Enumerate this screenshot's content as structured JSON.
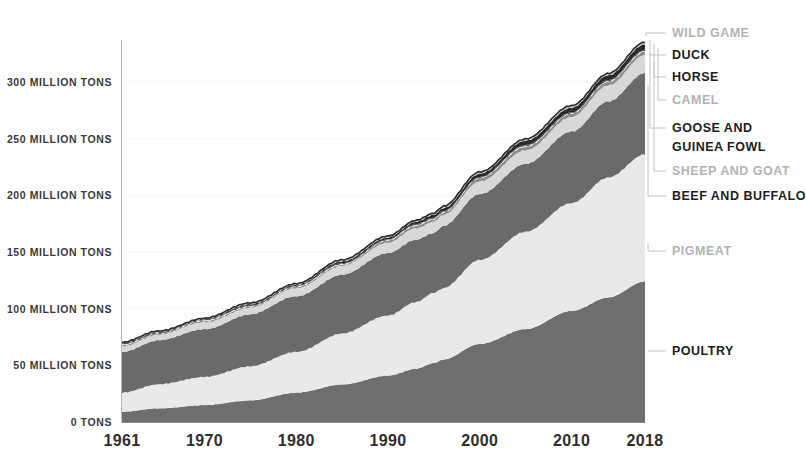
{
  "title": "",
  "axes": {
    "y_ticks": [
      {
        "label": "300 MILLION TONS",
        "value": 300
      },
      {
        "label": "250 MILLION TONS",
        "value": 250
      },
      {
        "label": "200 MILLION TONS",
        "value": 200
      },
      {
        "label": "150 MILLION TONS",
        "value": 150
      },
      {
        "label": "100 MILLION TONS",
        "value": 100
      },
      {
        "label": "50 MILLION TONS",
        "value": 50
      },
      {
        "label": "0 TONS",
        "value": 0
      }
    ],
    "x_ticks": [
      {
        "label": "1961",
        "value": 1961
      },
      {
        "label": "1970",
        "value": 1970
      },
      {
        "label": "1980",
        "value": 1980
      },
      {
        "label": "1990",
        "value": 1990
      },
      {
        "label": "2000",
        "value": 2000
      },
      {
        "label": "2010",
        "value": 2010
      },
      {
        "label": "2018",
        "value": 2018
      }
    ]
  },
  "legend": [
    {
      "name": "WILD GAME",
      "tone": "light",
      "color": "#b3b3b3"
    },
    {
      "name": "DUCK",
      "tone": "dark",
      "color": "#1d1d1d"
    },
    {
      "name": "HORSE",
      "tone": "dark",
      "color": "#1d1d1d"
    },
    {
      "name": "CAMEL",
      "tone": "light",
      "color": "#b3b3b3"
    },
    {
      "name": "GOOSE AND",
      "tone": "dark",
      "color": "#1d1d1d"
    },
    {
      "name": "GUINEA FOWL",
      "tone": "dark",
      "color": "#1d1d1d"
    },
    {
      "name": "SHEEP AND GOAT",
      "tone": "light",
      "color": "#b3b3b3"
    },
    {
      "name": "BEEF AND BUFFALO",
      "tone": "dark",
      "color": "#1d1d1d"
    },
    {
      "name": "PIGMEAT",
      "tone": "light",
      "color": "#b3b3b3"
    },
    {
      "name": "POULTRY",
      "tone": "dark",
      "color": "#4a4a4a"
    }
  ],
  "colors": {
    "poultry": "#6e6e6e",
    "pigmeat": "#e9e9e9",
    "beef_and_buffalo": "#6a6a6a",
    "sheep_and_goat": "#d8d8d8",
    "goose_and_guinea_fowl": "#8c8c8c",
    "camel": "#f0f0f0",
    "horse": "#4a4a4a",
    "duck": "#2a2a2a",
    "wild_game": "#c9c9c9",
    "gridline": "#d9d9d9",
    "background": "#ffffff",
    "axis_text": "#2e2e2e"
  },
  "chart_data": {
    "type": "area",
    "stacked": true,
    "title": "",
    "xlabel": "",
    "ylabel": "MILLION TONS",
    "xlim": [
      1961,
      2018
    ],
    "ylim": [
      0,
      340
    ],
    "grid": true,
    "legend_position": "right",
    "units": "million tons",
    "x": [
      1961,
      1965,
      1970,
      1975,
      1980,
      1985,
      1990,
      1993,
      1995,
      1996,
      2000,
      2005,
      2010,
      2014,
      2018
    ],
    "series": [
      {
        "name": "POULTRY",
        "color": "#6e6e6e",
        "values": [
          9,
          12,
          15,
          19,
          26,
          33,
          41,
          47,
          52,
          55,
          69,
          82,
          98,
          110,
          124
        ]
      },
      {
        "name": "PIGMEAT",
        "color": "#e9e9e9",
        "values": [
          17,
          21,
          25,
          30,
          36,
          45,
          53,
          59,
          62,
          63,
          74,
          86,
          95,
          106,
          112
        ]
      },
      {
        "name": "BEEF AND BUFFALO",
        "color": "#6a6a6a",
        "values": [
          36,
          39,
          42,
          46,
          49,
          52,
          55,
          55,
          53,
          55,
          58,
          60,
          63,
          67,
          72
        ]
      },
      {
        "name": "SHEEP AND GOAT",
        "color": "#d8d8d8",
        "values": [
          5,
          5,
          6,
          6,
          7,
          8,
          9,
          10,
          10,
          10,
          11,
          12,
          13,
          14,
          16
        ]
      },
      {
        "name": "GOOSE AND GUINEA FOWL",
        "color": "#8c8c8c",
        "values": [
          1,
          1,
          1,
          1,
          1,
          1,
          2,
          2,
          2,
          2,
          3,
          3,
          3,
          3,
          3
        ]
      },
      {
        "name": "CAMEL",
        "color": "#f0f0f0",
        "values": [
          0.4,
          0.4,
          0.5,
          0.5,
          0.5,
          0.6,
          0.6,
          0.6,
          0.6,
          0.6,
          0.6,
          0.6,
          0.6,
          0.6,
          0.7
        ]
      },
      {
        "name": "HORSE",
        "color": "#4a4a4a",
        "values": [
          0.5,
          0.5,
          0.6,
          0.6,
          0.6,
          0.7,
          0.7,
          0.7,
          0.7,
          0.7,
          0.7,
          0.7,
          0.8,
          0.8,
          0.8
        ]
      },
      {
        "name": "DUCK",
        "color": "#2a2a2a",
        "values": [
          0.4,
          0.5,
          0.6,
          0.8,
          1.0,
          1.3,
          1.7,
          2.0,
          2.2,
          2.3,
          3.0,
          3.6,
          4.1,
          4.4,
          4.6
        ]
      },
      {
        "name": "WILD GAME",
        "color": "#c9c9c9",
        "values": [
          0.8,
          0.9,
          1.0,
          1.1,
          1.2,
          1.3,
          1.4,
          1.5,
          1.5,
          1.5,
          1.6,
          1.7,
          1.8,
          1.8,
          1.9
        ]
      }
    ],
    "totals": [
      70.1,
      80.3,
      91.7,
      105,
      122.3,
      142.9,
      164.4,
      177.8,
      184,
      190.1,
      220.9,
      249.6,
      279.3,
      307.6,
      335
    ]
  }
}
